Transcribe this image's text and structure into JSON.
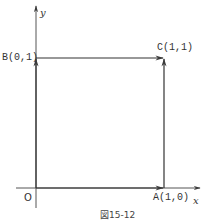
{
  "figure": {
    "caption": "図15-12",
    "axes": {
      "x_label": "x",
      "y_label": "y",
      "origin_label": "O"
    },
    "points": {
      "A": {
        "label": "A(1,0)",
        "x": 1,
        "y": 0
      },
      "B": {
        "label": "B(0,1)",
        "x": 0,
        "y": 1
      },
      "C": {
        "label": "C(1,1)",
        "x": 1,
        "y": 1
      }
    },
    "edges": [
      {
        "from": "O",
        "to": "A",
        "directed": true
      },
      {
        "from": "O",
        "to": "B",
        "directed": true
      },
      {
        "from": "B",
        "to": "C",
        "directed": true
      },
      {
        "from": "A",
        "to": "C",
        "directed": true
      }
    ],
    "colors": {
      "line": "#3a3a3a",
      "background": "#ffffff"
    }
  }
}
